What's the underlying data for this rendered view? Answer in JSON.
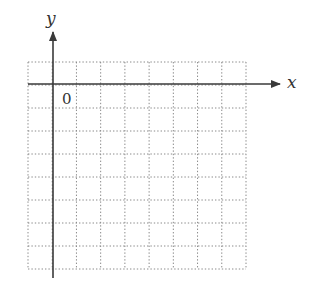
{
  "diagram": {
    "type": "coordinate-grid",
    "x_axis_label": "x",
    "y_axis_label": "y",
    "origin_label": "0",
    "grid": {
      "columns": 9,
      "rows": 9,
      "left": 28,
      "top": 62,
      "right": 246,
      "bottom": 269,
      "style": "dotted"
    },
    "axes": {
      "origin_x": 53,
      "origin_y": 84,
      "x_end": 280,
      "y_top": 32,
      "y_bottom": 278
    },
    "colors": {
      "axis": "#3a3a3a",
      "grid": "#8a8a8a",
      "background": "#ffffff"
    }
  }
}
